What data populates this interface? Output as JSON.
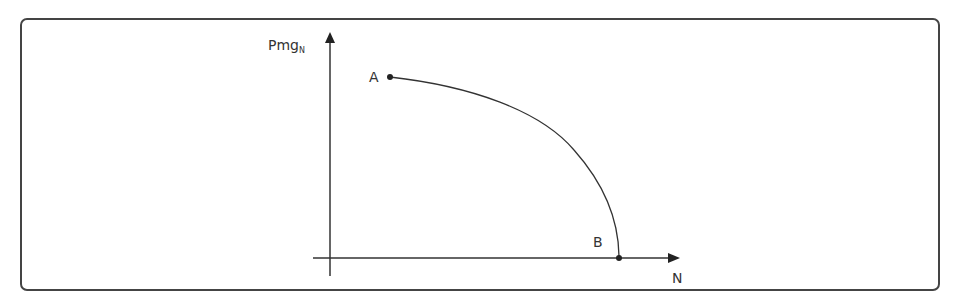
{
  "diagram": {
    "y_axis_label_main": "Pmg",
    "y_axis_label_sub": "N",
    "x_axis_label": "N",
    "point_a_label": "A",
    "point_b_label": "B",
    "curve": "concave-down curve from point A to point B on the N axis",
    "colors": {
      "stroke": "#333333",
      "frame": "#444444",
      "background": "#ffffff"
    }
  }
}
